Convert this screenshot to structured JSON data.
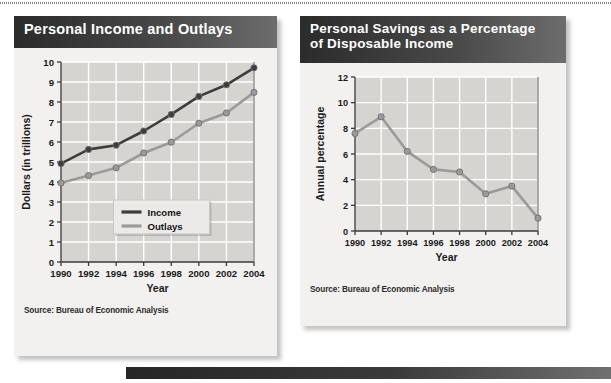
{
  "page": {
    "background_color": "#ffffff",
    "top_rule": "dotted-rule",
    "bottom_bar": "dark-gradient-bar"
  },
  "panels": [
    {
      "id": "income",
      "title": "Personal Income and Outlays",
      "source": "Source: Bureau of Economic Analysis"
    },
    {
      "id": "savings",
      "title_line1": "Personal Savings as a Percentage",
      "title_line2": "of Disposable Income",
      "source": "Source: Bureau of Economic Analysis"
    }
  ],
  "chart_data": [
    {
      "type": "line",
      "title": "Personal Income and Outlays",
      "xlabel": "Year",
      "ylabel": "Dollars (in trillions)",
      "categories": [
        1990,
        1992,
        1994,
        1996,
        1998,
        2000,
        2002,
        2004
      ],
      "xtick_labels": [
        "1990",
        "1992",
        "1994",
        "1996",
        "1998",
        "2000",
        "2002",
        "2004"
      ],
      "ytick_labels": [
        "0",
        "1",
        "2",
        "3",
        "4",
        "5",
        "6",
        "7",
        "8",
        "9",
        "10"
      ],
      "ylim": [
        0,
        10
      ],
      "xlim": [
        1990,
        2004
      ],
      "grid": true,
      "legend_position": "bottom-center",
      "series": [
        {
          "name": "Income",
          "color": "#3d3d3d",
          "values": [
            4.92,
            5.63,
            5.84,
            6.55,
            7.38,
            8.28,
            8.86,
            9.71
          ]
        },
        {
          "name": "Outlays",
          "color": "#9a9a9a",
          "values": [
            3.95,
            4.32,
            4.71,
            5.45,
            5.99,
            6.94,
            7.45,
            8.48
          ]
        }
      ]
    },
    {
      "type": "line",
      "title": "Personal Savings as a Percentage of Disposable Income",
      "xlabel": "Year",
      "ylabel": "Annual percentage",
      "categories": [
        1990,
        1992,
        1994,
        1996,
        1998,
        2000,
        2002,
        2004
      ],
      "xtick_labels": [
        "1990",
        "1992",
        "1994",
        "1996",
        "1998",
        "2000",
        "2002",
        "2004"
      ],
      "ytick_labels": [
        "0",
        "2",
        "4",
        "6",
        "8",
        "10",
        "12"
      ],
      "ylim": [
        0,
        12
      ],
      "xlim": [
        1990,
        2004
      ],
      "grid": true,
      "legend_position": "none",
      "series": [
        {
          "name": "Personal savings rate",
          "color": "#9a9a9a",
          "values": [
            7.6,
            8.9,
            6.2,
            4.8,
            4.6,
            2.9,
            3.5,
            1.0
          ]
        }
      ]
    }
  ]
}
